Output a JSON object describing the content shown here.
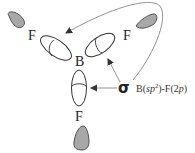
{
  "diagram": {
    "molecule": "BF3",
    "central_atom": "B",
    "ligands": [
      {
        "label": "F",
        "position": "upper-left"
      },
      {
        "label": "F",
        "position": "upper-right"
      },
      {
        "label": "F",
        "position": "bottom"
      }
    ],
    "bond_symbol": "σ",
    "bond_label_prefix": "B(",
    "bond_label_sp": "sp",
    "bond_label_sup": "2",
    "bond_label_mid": ")-F(2",
    "bond_label_p": "p",
    "bond_label_suffix": ")",
    "colors": {
      "lobe_fill": "#a8a8a8",
      "stroke": "#333333",
      "arrow": "#666666"
    }
  }
}
